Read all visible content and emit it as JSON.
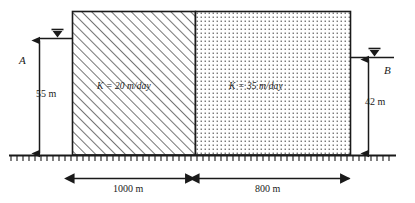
{
  "figure": {
    "type": "hydrogeology-cross-section"
  },
  "blocks": [
    {
      "id": "left-block",
      "fill": "diagonal-hatch",
      "label": "K = 20 m/day",
      "k_value": 20,
      "k_units": "m/day",
      "width_label": "1000 m",
      "width_value": 1000
    },
    {
      "id": "right-block",
      "fill": "dot-stipple",
      "label": "K = 35 m/day",
      "k_value": 35,
      "k_units": "m/day",
      "width_label": "800 m",
      "width_value": 800
    }
  ],
  "heads": [
    {
      "id": "left-head",
      "point_label": "A",
      "value_label": "55 m",
      "value": 55,
      "units": "m",
      "symbol": "water-table-triangle"
    },
    {
      "id": "right-head",
      "point_label": "B",
      "value_label": "42 m",
      "value": 42,
      "units": "m",
      "symbol": "water-table-triangle"
    }
  ],
  "ground": {
    "symbol": "hatched-datum-line",
    "label": ""
  },
  "colors": {
    "line": "#1a1a1a",
    "background": "#ffffff",
    "hatch": "#2b2b2b",
    "stipple": "#555555"
  }
}
